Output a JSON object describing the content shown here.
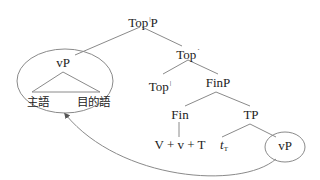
{
  "nodes": {
    "root": {
      "base": "Top",
      "sup": "|",
      "tail": "P"
    },
    "top_bar": {
      "base": "Top",
      "sup": "´"
    },
    "vp_fronted": "vP",
    "subject": "主語",
    "object": "目的語",
    "top_head": {
      "base": "Top",
      "sup": "|"
    },
    "finp": "FinP",
    "fin": "Fin",
    "tp": "TP",
    "fin_content": "V + v + T",
    "trace": {
      "base": "t",
      "sub": "T"
    },
    "vp_trace": "vP"
  },
  "colors": {
    "line": "#8a8a8a",
    "text": "#222222"
  }
}
